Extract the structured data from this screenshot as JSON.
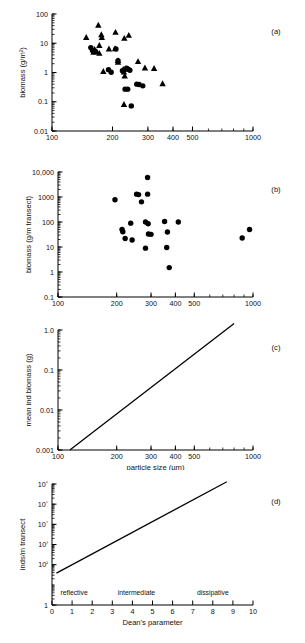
{
  "figure": {
    "title": "",
    "panel_labels": [
      "(a)",
      "(b)",
      "(c)",
      "(d)"
    ]
  },
  "chart_data": [
    {
      "id": "a",
      "type": "scatter",
      "panel_label": "(a)",
      "title": "",
      "xlabel": "",
      "ylabel": "biomass (g/m²)",
      "xscale": "log",
      "yscale": "log",
      "xlim": [
        100,
        1000
      ],
      "ylim": [
        0.01,
        100
      ],
      "xticks": [
        100,
        200,
        300,
        400,
        500,
        1000
      ],
      "xticklabels": [
        "100",
        "200",
        "300",
        "400",
        "500",
        "1000"
      ],
      "yticks": [
        0.01,
        0.1,
        1,
        10,
        100
      ],
      "yticklabels": [
        "0.01",
        "0.1",
        "1",
        "10",
        "100"
      ],
      "grid": false,
      "legend": "none",
      "series": [
        {
          "name": "triangles",
          "marker": "triangle",
          "color": "#000000",
          "points": [
            [
              148,
              16
            ],
            [
              170,
              42
            ],
            [
              176,
              20
            ],
            [
              177,
              16
            ],
            [
              172,
              8.5
            ],
            [
              163,
              6.2
            ],
            [
              161,
              5.0
            ],
            [
              167,
              5.2
            ],
            [
              172,
              4.6
            ],
            [
              207,
              24
            ],
            [
              229,
              15
            ],
            [
              241,
              19
            ],
            [
              192,
              6.5
            ],
            [
              206,
              6.6
            ],
            [
              180,
              1.1
            ],
            [
              213,
              2.3
            ],
            [
              213,
              2.6
            ],
            [
              226,
              1.3
            ],
            [
              228,
              1.05
            ],
            [
              230,
              0.78
            ],
            [
              233,
              1.35
            ],
            [
              268,
              2.4
            ],
            [
              290,
              1.45
            ],
            [
              322,
              1.4
            ],
            [
              355,
              0.42
            ],
            [
              228,
              0.082
            ]
          ]
        },
        {
          "name": "circles",
          "marker": "circle",
          "color": "#000000",
          "points": [
            [
              156,
              7.1
            ],
            [
              159,
              5.6
            ],
            [
              208,
              6.4
            ],
            [
              191,
              1.25
            ],
            [
              197,
              1.02
            ],
            [
              213,
              2.55
            ],
            [
              224,
              1.15
            ],
            [
              235,
              1.4
            ],
            [
              239,
              1.3
            ],
            [
              244,
              1.2
            ],
            [
              231,
              0.27
            ],
            [
              238,
              0.27
            ],
            [
              264,
              0.4
            ],
            [
              271,
              0.39
            ],
            [
              283,
              0.35
            ],
            [
              248,
              0.072
            ]
          ]
        }
      ]
    },
    {
      "id": "b",
      "type": "scatter",
      "panel_label": "(b)",
      "title": "",
      "xlabel": "",
      "ylabel": "biomass (g/m transect)",
      "xscale": "log",
      "yscale": "log",
      "xlim": [
        100,
        1000
      ],
      "ylim": [
        0.1,
        10000
      ],
      "xticks": [
        100,
        200,
        300,
        400,
        500,
        1000
      ],
      "xticklabels": [
        "100",
        "200",
        "300",
        "400",
        "500",
        "1000"
      ],
      "yticks": [
        0.1,
        1,
        10,
        100,
        1000,
        10000
      ],
      "yticklabels": [
        "0.1",
        "1",
        "10",
        "100",
        "1000",
        "10,000"
      ],
      "grid": false,
      "legend": "none",
      "series": [
        {
          "name": "circles",
          "marker": "circle",
          "color": "#000000",
          "points": [
            [
              288,
              6000
            ],
            [
              253,
              1300
            ],
            [
              259,
              1250
            ],
            [
              288,
              1300
            ],
            [
              196,
              780
            ],
            [
              268,
              640
            ],
            [
              236,
              90
            ],
            [
              281,
              100
            ],
            [
              352,
              105
            ],
            [
              414,
              100
            ],
            [
              213,
              50
            ],
            [
              215,
              41
            ],
            [
              290,
              85
            ],
            [
              291,
              33
            ],
            [
              300,
              32
            ],
            [
              364,
              40
            ],
            [
              880,
              23
            ],
            [
              960,
              50
            ],
            [
              221,
              22
            ],
            [
              240,
              19
            ],
            [
              281,
              9
            ],
            [
              361,
              9.5
            ],
            [
              372,
              1.5
            ]
          ]
        }
      ]
    },
    {
      "id": "c",
      "type": "line",
      "panel_label": "(c)",
      "title": "",
      "xlabel": "particle size (µm)",
      "ylabel": "mean ind biomass (g)",
      "xscale": "log",
      "yscale": "log",
      "xlim": [
        100,
        1000
      ],
      "ylim": [
        0.001,
        1.0
      ],
      "xticks": [
        100,
        200,
        300,
        400,
        500,
        1000
      ],
      "xticklabels": [
        "100",
        "200",
        "300",
        "400",
        "500",
        "1000"
      ],
      "yticks": [
        0.001,
        0.01,
        0.1,
        1.0
      ],
      "yticklabels": [
        "0.001",
        "0.01",
        "0.1",
        "1.0"
      ],
      "grid": false,
      "legend": "none",
      "series": [
        {
          "name": "regression",
          "marker": "none",
          "color": "#000000",
          "points": [
            [
              115,
              0.001
            ],
            [
              800,
              1.45
            ]
          ]
        }
      ]
    },
    {
      "id": "d",
      "type": "line",
      "panel_label": "(d)",
      "title": "",
      "xlabel": "Dean's parameter",
      "ylabel": "inds/m transect",
      "xscale": "linear",
      "yscale": "log",
      "xlim": [
        0,
        10
      ],
      "ylim": [
        1,
        1000000
      ],
      "xticks": [
        0,
        1,
        2,
        3,
        4,
        5,
        6,
        7,
        8,
        9,
        10
      ],
      "xticklabels": [
        "0",
        "1",
        "2",
        "3",
        "4",
        "5",
        "6",
        "7",
        "8",
        "9",
        "10"
      ],
      "yticks": [
        1,
        100,
        1000,
        10000,
        100000,
        1000000
      ],
      "yticklabels": [
        "1",
        "10²",
        "10³",
        "10⁴",
        "10⁵",
        "10⁶"
      ],
      "grid": false,
      "legend": "none",
      "annotations": [
        {
          "text": "reflective",
          "x": 1.1,
          "y": 3.2
        },
        {
          "text": "intermediate",
          "x": 4.2,
          "y": 3.2
        },
        {
          "text": "dissipative",
          "x": 8.0,
          "y": 3.2
        }
      ],
      "series": [
        {
          "name": "regression",
          "marker": "none",
          "color": "#000000",
          "points": [
            [
              0.22,
              38
            ],
            [
              8.7,
              1300000
            ]
          ]
        }
      ]
    }
  ]
}
